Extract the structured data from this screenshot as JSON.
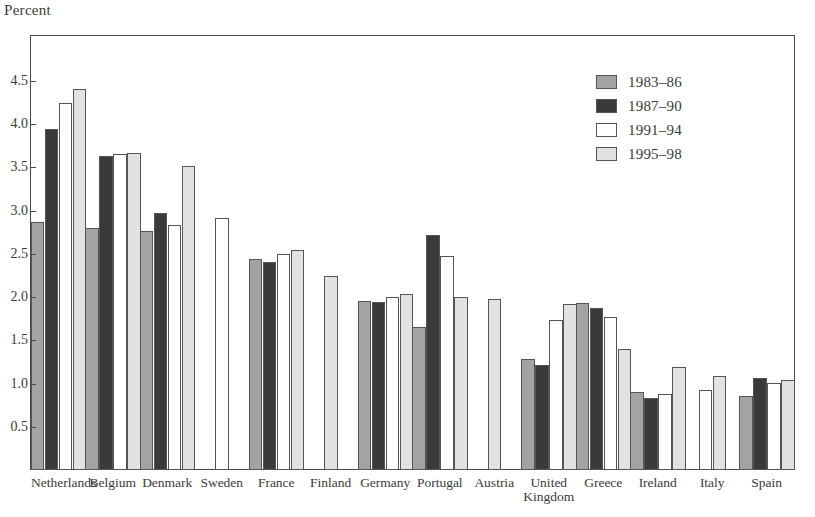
{
  "chart_data": {
    "type": "bar",
    "title": "",
    "subtitle": "",
    "ylabel": "Percent",
    "xlabel": "",
    "ylim": [
      0,
      4.75
    ],
    "yticks": [
      0.5,
      1.0,
      1.5,
      2.0,
      2.5,
      3.0,
      3.5,
      4.0,
      4.5
    ],
    "ytick_labels": [
      "0.5",
      "1.0",
      "1.5",
      "2.0",
      "2.5",
      "3.0",
      "3.5",
      "4.0",
      "4.5"
    ],
    "grid": false,
    "legend_position": "top-right",
    "categories": [
      "Netherlands",
      "Belgium",
      "Denmark",
      "Sweden",
      "France",
      "Finland",
      "Germany",
      "Portugal",
      "Austria",
      "United\nKingdom",
      "Greece",
      "Ireland",
      "Italy",
      "Spain"
    ],
    "series": [
      {
        "name": "1983–86",
        "color": "#a3a3a3",
        "values": [
          2.87,
          2.8,
          2.77,
          null,
          2.44,
          null,
          1.96,
          1.66,
          null,
          1.28,
          1.93,
          0.9,
          null,
          0.86
        ]
      },
      {
        "name": "1987–90",
        "color": "#3a3a3a",
        "values": [
          3.94,
          3.63,
          2.97,
          null,
          2.41,
          null,
          1.94,
          2.72,
          null,
          1.22,
          1.88,
          0.83,
          null,
          1.07
        ]
      },
      {
        "name": "1991–94",
        "color": "#ffffff",
        "values": [
          4.25,
          3.66,
          2.84,
          2.92,
          2.5,
          null,
          2.0,
          2.48,
          null,
          1.74,
          1.77,
          0.88,
          0.93,
          1.01
        ]
      },
      {
        "name": "1995–98",
        "color": "#e2e2e2",
        "values": [
          4.41,
          3.67,
          3.52,
          null,
          2.55,
          2.25,
          2.04,
          2.0,
          1.98,
          1.92,
          1.4,
          1.19,
          1.09,
          1.04
        ]
      }
    ]
  },
  "legend": {
    "entries": [
      "1983–86",
      "1987–90",
      "1991–94",
      "1995–98"
    ]
  }
}
